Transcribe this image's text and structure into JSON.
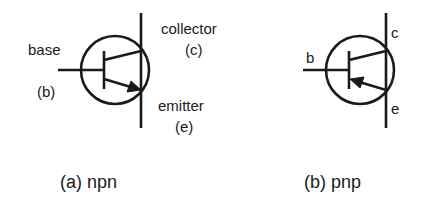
{
  "figure": {
    "npn": {
      "caption": "(a) npn",
      "labels": {
        "base": "base",
        "base_sym": "(b)",
        "collector": "collector",
        "collector_sym": "(c)",
        "emitter": "emitter",
        "emitter_sym": "(e)"
      },
      "arrow_direction": "outward (toward emitter)"
    },
    "pnp": {
      "caption": "(b) pnp",
      "labels": {
        "base": "b",
        "collector": "c",
        "emitter": "e"
      },
      "arrow_direction": "inward (toward base)"
    },
    "colors": {
      "stroke": "#1a1a1a",
      "background": "#ffffff"
    }
  }
}
